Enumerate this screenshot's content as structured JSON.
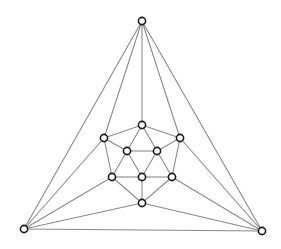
{
  "diagram": {
    "type": "planar-graph",
    "edge_color": "#8a8a8a",
    "node_stroke": "#1a1a1a",
    "node_fill": "#ffffff",
    "node_radius": 3.6,
    "nodes": [
      {
        "id": "top",
        "x": 142,
        "y": 21
      },
      {
        "id": "ctop",
        "x": 142,
        "y": 125
      },
      {
        "id": "lup",
        "x": 104,
        "y": 138
      },
      {
        "id": "rup",
        "x": 180,
        "y": 138
      },
      {
        "id": "il",
        "x": 127,
        "y": 151
      },
      {
        "id": "ir",
        "x": 157,
        "y": 151
      },
      {
        "id": "ml",
        "x": 112,
        "y": 177
      },
      {
        "id": "mc",
        "x": 142,
        "y": 177
      },
      {
        "id": "mr",
        "x": 172,
        "y": 177
      },
      {
        "id": "bc",
        "x": 142,
        "y": 203
      },
      {
        "id": "bl",
        "x": 24,
        "y": 229
      },
      {
        "id": "br",
        "x": 262,
        "y": 231
      }
    ],
    "edges": [
      [
        "top",
        "bl"
      ],
      [
        "top",
        "lup"
      ],
      [
        "top",
        "ctop"
      ],
      [
        "top",
        "rup"
      ],
      [
        "top",
        "br"
      ],
      [
        "bl",
        "lup"
      ],
      [
        "bl",
        "ml"
      ],
      [
        "bl",
        "bc"
      ],
      [
        "bl",
        "br"
      ],
      [
        "br",
        "rup"
      ],
      [
        "br",
        "mr"
      ],
      [
        "br",
        "bc"
      ],
      [
        "ctop",
        "lup"
      ],
      [
        "ctop",
        "rup"
      ],
      [
        "ctop",
        "il"
      ],
      [
        "ctop",
        "ir"
      ],
      [
        "lup",
        "il"
      ],
      [
        "lup",
        "ml"
      ],
      [
        "rup",
        "ir"
      ],
      [
        "rup",
        "mr"
      ],
      [
        "il",
        "ir"
      ],
      [
        "il",
        "ml"
      ],
      [
        "il",
        "mc"
      ],
      [
        "ir",
        "mc"
      ],
      [
        "ir",
        "mr"
      ],
      [
        "ml",
        "mc"
      ],
      [
        "mc",
        "mr"
      ],
      [
        "ml",
        "bc"
      ],
      [
        "mc",
        "bc"
      ],
      [
        "mr",
        "bc"
      ]
    ]
  }
}
